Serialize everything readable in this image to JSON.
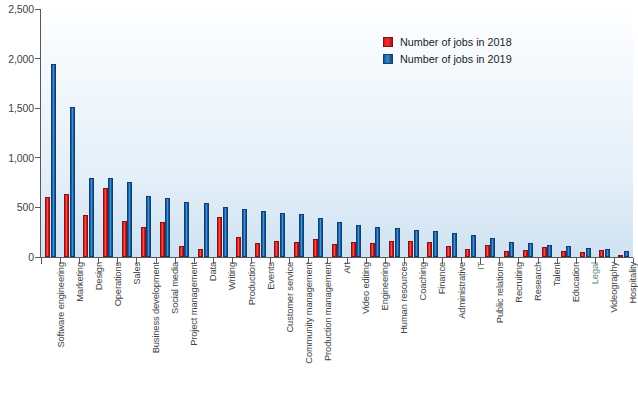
{
  "chart_data": {
    "type": "bar",
    "title": "",
    "xlabel": "",
    "ylabel": "",
    "ylim": [
      0,
      2500
    ],
    "yticks": [
      0,
      500,
      1000,
      1500,
      2000,
      2500
    ],
    "ytick_labels": [
      "0",
      "500",
      "1,000",
      "1,500",
      "2,000",
      "2,500"
    ],
    "grid": false,
    "legend_position": "top-right",
    "categories": [
      "Software engineering",
      "Marketing",
      "Design",
      "Operations",
      "Sales",
      "Business development",
      "Social media",
      "Project management",
      "Data",
      "Writing",
      "Production",
      "Events",
      "Customer service",
      "Community management",
      "Production management",
      "Art",
      "Video editing",
      "Engineering",
      "Human resources",
      "Coaching",
      "Finance",
      "Administrative",
      "IT",
      "Public relations",
      "Recruiting",
      "Research",
      "Talent",
      "Education",
      "Legal",
      "Videography",
      "Hospitality"
    ],
    "series": [
      {
        "name": "Number of jobs in 2018",
        "color": "#e02b28",
        "values": [
          610,
          640,
          420,
          700,
          360,
          300,
          350,
          110,
          80,
          400,
          200,
          145,
          165,
          155,
          180,
          130,
          150,
          140,
          165,
          160,
          150,
          110,
          80,
          120,
          60,
          75,
          105,
          60,
          55,
          70,
          20
        ]
      },
      {
        "name": "Number of jobs in 2019",
        "color": "#1f6cb5",
        "values": [
          1950,
          1510,
          800,
          800,
          755,
          620,
          590,
          550,
          545,
          505,
          480,
          460,
          440,
          430,
          390,
          350,
          320,
          300,
          290,
          275,
          265,
          240,
          225,
          195,
          150,
          140,
          120,
          110,
          95,
          85,
          60
        ]
      }
    ]
  },
  "legend": {
    "items": [
      {
        "label": "Number of jobs in 2018",
        "swatch": "red"
      },
      {
        "label": "Number of jobs in 2019",
        "swatch": "blue"
      }
    ]
  }
}
